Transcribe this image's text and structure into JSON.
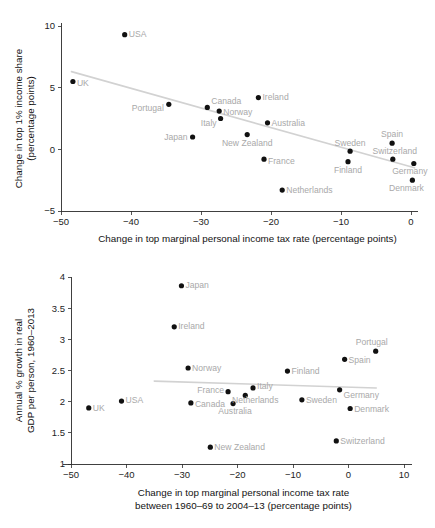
{
  "figures": [
    {
      "id": "top",
      "chart_data": {
        "type": "scatter",
        "title": "",
        "xlabel": "Change in top marginal personal income tax rate (percentage points)",
        "ylabel_line1": "Change in top 1% income share",
        "ylabel_line2": "(percentage points)",
        "xlim": [
          -50,
          1
        ],
        "ylim": [
          -5,
          10
        ],
        "xticks": [
          -50,
          -40,
          -30,
          -20,
          -10,
          0
        ],
        "xticklabels": [
          "−50",
          "−40",
          "−30",
          "−20",
          "−10",
          "0"
        ],
        "yticks": [
          10,
          5,
          0,
          -5
        ],
        "yticklabels": [
          "10",
          "5",
          "0",
          "−5"
        ],
        "grid": false,
        "legend": "none",
        "trendline": {
          "x": [
            -48.5,
            0.5
          ],
          "y": [
            6.3,
            -1.5
          ]
        },
        "points": [
          {
            "label": "UK",
            "x": -48.3,
            "y": 5.5,
            "anchor": "right",
            "dx": 4,
            "dy": 4.5
          },
          {
            "label": "USA",
            "x": -40.9,
            "y": 9.3,
            "anchor": "right",
            "dx": 4,
            "dy": 2.5
          },
          {
            "label": "Portugal",
            "x": -34.6,
            "y": 3.65,
            "anchor": "left",
            "dx": -5,
            "dy": 7
          },
          {
            "label": "Japan",
            "x": -31.2,
            "y": 1.0,
            "anchor": "left",
            "dx": -5,
            "dy": 3
          },
          {
            "label": "Canada",
            "x": -29.1,
            "y": 3.4,
            "anchor": "right",
            "dx": 4,
            "dy": -3
          },
          {
            "label": "Norway",
            "x": -27.4,
            "y": 3.1,
            "anchor": "right",
            "dx": 4,
            "dy": 4
          },
          {
            "label": "Italy",
            "x": -27.2,
            "y": 2.5,
            "anchor": "left",
            "dx": -4,
            "dy": 7
          },
          {
            "label": "New Zealand",
            "x": -23.4,
            "y": 1.2,
            "anchor": "mid",
            "dx": 0,
            "dy": 11
          },
          {
            "label": "Ireland",
            "x": -21.8,
            "y": 4.2,
            "anchor": "right",
            "dx": 4,
            "dy": 2.5
          },
          {
            "label": "Australia",
            "x": -20.5,
            "y": 2.15,
            "anchor": "right",
            "dx": 4,
            "dy": 3
          },
          {
            "label": "France",
            "x": -21.0,
            "y": -0.8,
            "anchor": "right",
            "dx": 4,
            "dy": 5
          },
          {
            "label": "Netherlands",
            "x": -18.4,
            "y": -3.3,
            "anchor": "right",
            "dx": 4,
            "dy": 3
          },
          {
            "label": "Finland",
            "x": -9.0,
            "y": -1.0,
            "anchor": "mid",
            "dx": 0,
            "dy": 11
          },
          {
            "label": "Sweden",
            "x": -8.7,
            "y": -0.15,
            "anchor": "mid",
            "dx": 0,
            "dy": -5
          },
          {
            "label": "Spain",
            "x": -2.7,
            "y": 0.5,
            "anchor": "mid",
            "dx": 0,
            "dy": -6
          },
          {
            "label": "Switzerland",
            "x": -2.6,
            "y": -0.8,
            "anchor": "mid",
            "dx": 2,
            "dy": -5
          },
          {
            "label": "Germany",
            "x": 0.4,
            "y": -1.15,
            "anchor": "mid",
            "dx": -4,
            "dy": 10
          },
          {
            "label": "Denmark",
            "x": 0.2,
            "y": -2.5,
            "anchor": "mid",
            "dx": -6,
            "dy": 11
          }
        ]
      }
    },
    {
      "id": "bottom",
      "chart_data": {
        "type": "scatter",
        "title": "",
        "xlabel_line1": "Change in top marginal personal income tax rate",
        "xlabel_line2": "between 1960–69 to 2004–13 (percentage points)",
        "ylabel_line1": "Annual % growth in real",
        "ylabel_line2": "GDP per person, 1960–2013",
        "xlim": [
          -50,
          10
        ],
        "ylim": [
          1,
          4
        ],
        "xticks": [
          -50,
          -40,
          -30,
          -20,
          -10,
          0,
          10
        ],
        "xticklabels": [
          "−50",
          "−40",
          "−30",
          "−20",
          "−10",
          "0",
          "10"
        ],
        "yticks": [
          4,
          3.5,
          3,
          2.5,
          2,
          1.5,
          1
        ],
        "yticklabels": [
          "4",
          "3.5",
          "3",
          "2.5",
          "2",
          "1.5",
          "1"
        ],
        "grid": false,
        "legend": "none",
        "trendline": {
          "x": [
            -35.0,
            5.0
          ],
          "y": [
            2.33,
            2.22
          ]
        },
        "points": [
          {
            "label": "UK",
            "x": -46.8,
            "y": 1.9,
            "anchor": "right",
            "dx": 4,
            "dy": 3
          },
          {
            "label": "USA",
            "x": -40.9,
            "y": 2.01,
            "anchor": "right",
            "dx": 4,
            "dy": 2
          },
          {
            "label": "Ireland",
            "x": -31.4,
            "y": 3.2,
            "anchor": "right",
            "dx": 4,
            "dy": 2.5
          },
          {
            "label": "Japan",
            "x": -30.1,
            "y": 3.86,
            "anchor": "right",
            "dx": 4,
            "dy": 2
          },
          {
            "label": "Norway",
            "x": -28.9,
            "y": 2.54,
            "anchor": "right",
            "dx": 4,
            "dy": 2.5
          },
          {
            "label": "Canada",
            "x": -28.4,
            "y": 1.98,
            "anchor": "right",
            "dx": 4,
            "dy": 4
          },
          {
            "label": "New Zealand",
            "x": -24.9,
            "y": 1.27,
            "anchor": "right",
            "dx": 4,
            "dy": 3
          },
          {
            "label": "France",
            "x": -21.7,
            "y": 2.16,
            "anchor": "left",
            "dx": -4,
            "dy": 1
          },
          {
            "label": "Australia",
            "x": -20.8,
            "y": 1.97,
            "anchor": "mid",
            "dx": 2,
            "dy": 10
          },
          {
            "label": "Netherlands",
            "x": -18.6,
            "y": 2.1,
            "anchor": "mid",
            "dx": 10,
            "dy": 8
          },
          {
            "label": "Italy",
            "x": -17.2,
            "y": 2.22,
            "anchor": "right",
            "dx": 4,
            "dy": 1
          },
          {
            "label": "Finland",
            "x": -11.0,
            "y": 2.49,
            "anchor": "right",
            "dx": 4,
            "dy": 2.5
          },
          {
            "label": "Sweden",
            "x": -8.4,
            "y": 2.03,
            "anchor": "right",
            "dx": 4,
            "dy": 3
          },
          {
            "label": "Switzerland",
            "x": -2.2,
            "y": 1.37,
            "anchor": "right",
            "dx": 4,
            "dy": 3
          },
          {
            "label": "Germany",
            "x": -1.6,
            "y": 2.19,
            "anchor": "right",
            "dx": 4,
            "dy": 8
          },
          {
            "label": "Spain",
            "x": -0.7,
            "y": 2.68,
            "anchor": "right",
            "dx": 4,
            "dy": 4
          },
          {
            "label": "Denmark",
            "x": 0.3,
            "y": 1.89,
            "anchor": "right",
            "dx": 4,
            "dy": 3
          },
          {
            "label": "Portugal",
            "x": 4.9,
            "y": 2.81,
            "anchor": "mid",
            "dx": -4,
            "dy": -6
          }
        ]
      }
    }
  ]
}
